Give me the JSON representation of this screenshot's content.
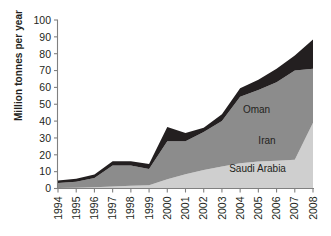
{
  "chart_data": {
    "type": "area",
    "stacked": true,
    "title": "",
    "subtitle": "",
    "xlabel": "",
    "ylabel": "Million tonnes per year",
    "categories": [
      "1994",
      "1995",
      "1996",
      "1997",
      "1998",
      "1999",
      "2000",
      "2001",
      "2002",
      "2003",
      "2004",
      "2005",
      "2006",
      "2007",
      "2008"
    ],
    "x": [
      1994,
      1995,
      1996,
      1997,
      1998,
      1999,
      2000,
      2001,
      2002,
      2003,
      2004,
      2005,
      2006,
      2007,
      2008
    ],
    "ylim": [
      0,
      100
    ],
    "xlim": [
      1994,
      2008
    ],
    "yticks": [
      0,
      10,
      20,
      30,
      40,
      50,
      60,
      70,
      80,
      90,
      100
    ],
    "ytick_labels": [
      "0",
      "10",
      "20",
      "30",
      "40",
      "50",
      "60",
      "70",
      "80",
      "90",
      "100"
    ],
    "grid": false,
    "legend_position": "inline-annotations",
    "series": [
      {
        "name": "Saudi Arabia",
        "color": "#cfcfcf",
        "values": [
          0.3,
          0.5,
          0.8,
          1.2,
          1.6,
          2.0,
          5.5,
          8.5,
          11.0,
          13.0,
          15.0,
          16.0,
          16.5,
          17.0,
          39.0
        ]
      },
      {
        "name": "Iran",
        "color": "#8c8c8c",
        "values": [
          3.0,
          3.5,
          5.5,
          12.5,
          12.0,
          9.5,
          22.5,
          19.5,
          22.5,
          27.0,
          39.5,
          42.5,
          46.5,
          53.0,
          32.0
        ]
      },
      {
        "name": "Oman",
        "color": "#231f20",
        "values": [
          1.5,
          1.8,
          2.0,
          2.5,
          2.5,
          3.0,
          8.5,
          5.0,
          2.5,
          4.0,
          5.0,
          6.0,
          8.0,
          9.0,
          17.5
        ]
      }
    ],
    "totals": [
      4.8,
      5.8,
      8.3,
      16.2,
      16.1,
      14.5,
      36.5,
      33.0,
      36.0,
      44.0,
      59.5,
      64.5,
      71.0,
      79.0,
      88.5
    ],
    "annotations": [
      {
        "text": "Oman",
        "x": 2004.15,
        "y": 45.0
      },
      {
        "text": "Iran",
        "x": 2005.0,
        "y": 26.5
      },
      {
        "text": "Saudi Arabia",
        "x": 2003.4,
        "y": 10.0
      }
    ]
  },
  "axis": {
    "y_title": "Million tonnes per year"
  }
}
